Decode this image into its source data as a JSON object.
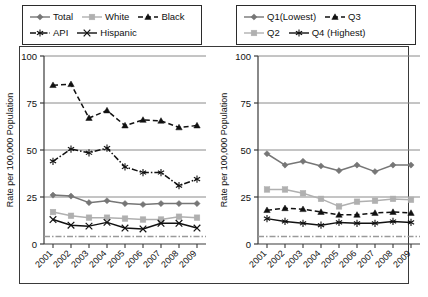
{
  "figure": {
    "width": 428,
    "height": 297,
    "background": "#ffffff"
  },
  "colors": {
    "total": "#767676",
    "white": "#b0b0b0",
    "black": "#111111",
    "api": "#111111",
    "hispanic": "#111111",
    "q1": "#767676",
    "q2": "#b0b0b0",
    "q3": "#111111",
    "q4": "#111111",
    "gridline": "#8a8a8a",
    "axis": "#3a3a3a",
    "reference_line": "#9a9a9a",
    "frame": "#3a3a3a"
  },
  "panels": [
    {
      "id": "race-ethnicity",
      "legend": {
        "rows": [
          [
            {
              "label": "Total",
              "marker": "diamond",
              "line": "solid",
              "color": "#767676"
            },
            {
              "label": "White",
              "marker": "square",
              "line": "solid",
              "color": "#b0b0b0"
            },
            {
              "label": "Black",
              "marker": "triangle",
              "line": "dashed",
              "color": "#111111"
            }
          ],
          [
            {
              "label": "API",
              "marker": "asterisk",
              "line": "dashdot",
              "color": "#111111"
            },
            {
              "label": "Hispanic",
              "marker": "cross",
              "line": "solid",
              "color": "#111111"
            }
          ]
        ]
      },
      "chart_data": {
        "type": "line",
        "title": "",
        "xlabel": "",
        "ylabel": "Rate per 100,000 Population",
        "x": [
          "2001",
          "2002",
          "2003",
          "2004",
          "2005",
          "2006",
          "2007",
          "2008",
          "2009"
        ],
        "xtick_labels": [
          "2001",
          "2002",
          "2003",
          "2004",
          "2005",
          "2006",
          "2007",
          "2008",
          "2009"
        ],
        "ylim": [
          0,
          100
        ],
        "yticks": [
          0,
          25,
          50,
          75,
          100
        ],
        "grid": "horizontal",
        "legend_position": "above",
        "reference_line": {
          "value": 4,
          "style": "dashdot",
          "color": "#9a9a9a"
        },
        "series": [
          {
            "name": "Total",
            "marker": "diamond",
            "line": "solid",
            "color": "#767676",
            "values": [
              26,
              25.5,
              22,
              23,
              21.5,
              21,
              21.5,
              21.5,
              21.5
            ]
          },
          {
            "name": "White",
            "marker": "square",
            "line": "solid",
            "color": "#b0b0b0",
            "values": [
              17,
              15,
              14,
              14,
              13.5,
              13,
              13,
              14.5,
              14
            ]
          },
          {
            "name": "Black",
            "marker": "triangle",
            "line": "dashed",
            "color": "#111111",
            "values": [
              84.5,
              85,
              67,
              71,
              63,
              66,
              65.5,
              62,
              63
            ]
          },
          {
            "name": "API",
            "marker": "asterisk",
            "line": "dashdot",
            "color": "#111111",
            "values": [
              44,
              50.5,
              48.5,
              51,
              41,
              38,
              38,
              31,
              34.5
            ]
          },
          {
            "name": "Hispanic",
            "marker": "cross",
            "line": "solid",
            "color": "#111111",
            "values": [
              13,
              10,
              9.5,
              11.5,
              8.5,
              8,
              11,
              11,
              8.5
            ]
          }
        ]
      }
    },
    {
      "id": "income-quartile",
      "legend": {
        "rows": [
          [
            {
              "label": "Q1(Lowest)",
              "marker": "diamond",
              "line": "solid",
              "color": "#767676"
            },
            {
              "label": "Q3",
              "marker": "triangle",
              "line": "dashed",
              "color": "#111111"
            }
          ],
          [
            {
              "label": "Q2",
              "marker": "square",
              "line": "solid",
              "color": "#b0b0b0"
            },
            {
              "label": "Q4 (Highest)",
              "marker": "asterisk",
              "line": "solid",
              "color": "#111111"
            }
          ]
        ]
      },
      "chart_data": {
        "type": "line",
        "title": "",
        "xlabel": "",
        "ylabel": "Rate per 100,000 Population",
        "x": [
          "2001",
          "2002",
          "2003",
          "2004",
          "2005",
          "2006",
          "2007",
          "2008",
          "2009"
        ],
        "xtick_labels": [
          "2001",
          "2002",
          "2003",
          "2004",
          "2005",
          "2006",
          "2007",
          "2008",
          "2009"
        ],
        "ylim": [
          0,
          100
        ],
        "yticks": [
          0,
          25,
          50,
          75,
          100
        ],
        "grid": "horizontal",
        "legend_position": "above",
        "reference_line": {
          "value": 4,
          "style": "dashdot",
          "color": "#9a9a9a"
        },
        "series": [
          {
            "name": "Q1(Lowest)",
            "marker": "diamond",
            "line": "solid",
            "color": "#767676",
            "values": [
              48,
              42,
              44,
              41.5,
              39,
              42,
              38.5,
              42,
              42
            ]
          },
          {
            "name": "Q2",
            "marker": "square",
            "line": "solid",
            "color": "#b0b0b0",
            "values": [
              29,
              29,
              27,
              24,
              20,
              22.5,
              23,
              24,
              23.5
            ]
          },
          {
            "name": "Q3",
            "marker": "triangle",
            "line": "dashed",
            "color": "#111111",
            "values": [
              18,
              19,
              18.5,
              17,
              15.5,
              15.5,
              16.5,
              17,
              16.5
            ]
          },
          {
            "name": "Q4 (Highest)",
            "marker": "asterisk",
            "line": "solid",
            "color": "#111111",
            "values": [
              13.5,
              12,
              11,
              10,
              11.5,
              11,
              11,
              12,
              11.5
            ]
          }
        ]
      }
    }
  ]
}
